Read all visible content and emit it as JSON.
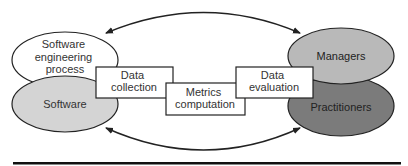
{
  "diagram": {
    "nodes": {
      "sw_process": {
        "lines": [
          "Software",
          "engineering",
          "process"
        ],
        "fill": "#ffffff"
      },
      "software": {
        "label": "Software",
        "fill": "#d4d4d4"
      },
      "managers": {
        "label": "Managers",
        "fill": "#b9b9b9"
      },
      "practitioners": {
        "label": "Practitioners",
        "fill": "#7b7b7b"
      }
    },
    "boxes": {
      "data_collection": {
        "lines": [
          "Data",
          "collection"
        ]
      },
      "metrics_computation": {
        "lines": [
          "Metrics",
          "computation"
        ]
      },
      "data_evaluation": {
        "lines": [
          "Data",
          "evaluation"
        ]
      }
    },
    "edges": [
      {
        "from": "managers",
        "to": "sw_process",
        "type": "feedback-arc-top",
        "bidirectional": true
      },
      {
        "from": "software",
        "to": "practitioners",
        "type": "feedback-arc-bottom",
        "bidirectional": true
      }
    ],
    "colors": {
      "stroke": "#222222",
      "text": "#333333",
      "rule": "#111111"
    }
  }
}
